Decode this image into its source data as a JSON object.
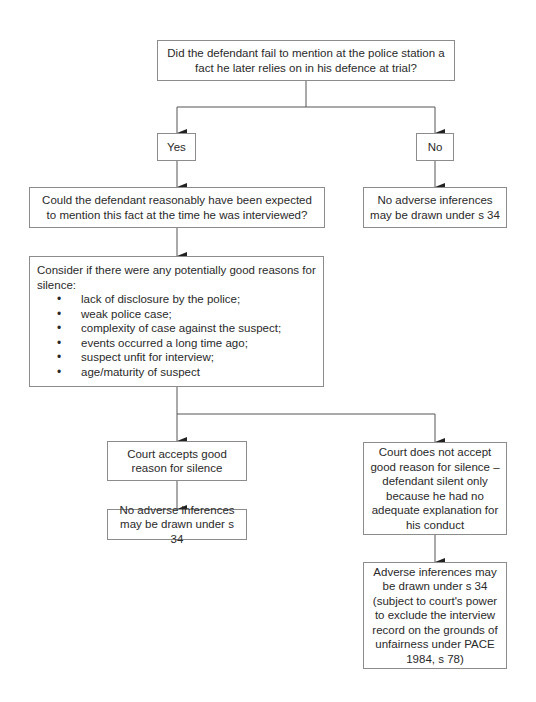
{
  "diagram": {
    "type": "flowchart",
    "nodes": {
      "q1": "Did the defendant fail to mention at the police station a fact he later relies on in his defence at trial?",
      "yes": "Yes",
      "no": "No",
      "q2": "Could the defendant reasonably have been expected to mention this fact at the time he was interviewed?",
      "no_inference_1": "No adverse inferences may be drawn under s 34",
      "consider_intro": "Consider if there were any potentially good reasons for silence:",
      "consider_items": [
        "lack of disclosure by the police;",
        "weak police case;",
        "complexity of case against the suspect;",
        "events occurred a long time ago;",
        "suspect unfit for interview;",
        "age/maturity of suspect"
      ],
      "court_accepts": "Court accepts good reason for silence",
      "no_inference_2": "No adverse inferences may be drawn under s 34",
      "court_rejects": "Court does not accept good reason for silence – defendant silent only because he had no adequate explanation for his conduct",
      "adverse": "Adverse inferences may be drawn under s 34 (subject to court's power to exclude the interview record on the grounds of unfairness under PACE 1984, s 78)"
    },
    "edges": [
      {
        "from": "q1",
        "to": "yes"
      },
      {
        "from": "q1",
        "to": "no"
      },
      {
        "from": "yes",
        "to": "q2"
      },
      {
        "from": "no",
        "to": "no_inference_1"
      },
      {
        "from": "q2",
        "to": "consider"
      },
      {
        "from": "consider",
        "to": "court_accepts"
      },
      {
        "from": "consider",
        "to": "court_rejects"
      },
      {
        "from": "court_accepts",
        "to": "no_inference_2"
      },
      {
        "from": "court_rejects",
        "to": "adverse"
      }
    ],
    "colors": {
      "border": "#8c8c8c",
      "line": "#444444",
      "text": "#2a2a2a"
    }
  }
}
